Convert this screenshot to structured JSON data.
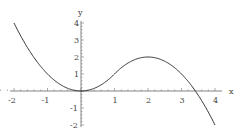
{
  "chart_data": {
    "type": "line",
    "title": "",
    "xlabel": "x",
    "ylabel": "y",
    "xlim": [
      -2,
      4
    ],
    "ylim": [
      -2,
      4
    ],
    "x_ticks": [
      "-2",
      "-1",
      "1",
      "2",
      "3",
      "4"
    ],
    "y_ticks": [
      "4",
      "3",
      "2",
      "1",
      "-1",
      "-2"
    ],
    "grid": false,
    "series": [
      {
        "name": "f(x)",
        "description": "piecewise: x^2 for x<1, 2-(x-2)^2 for x>=1",
        "x": [
          -2,
          -1.5,
          -1,
          -0.5,
          0,
          0.5,
          1,
          1.5,
          2,
          2.5,
          3,
          3.5,
          4
        ],
        "y": [
          4,
          2.25,
          1,
          0.25,
          0,
          0.25,
          1,
          1.75,
          2,
          1.75,
          1,
          -0.25,
          -2
        ]
      }
    ]
  }
}
